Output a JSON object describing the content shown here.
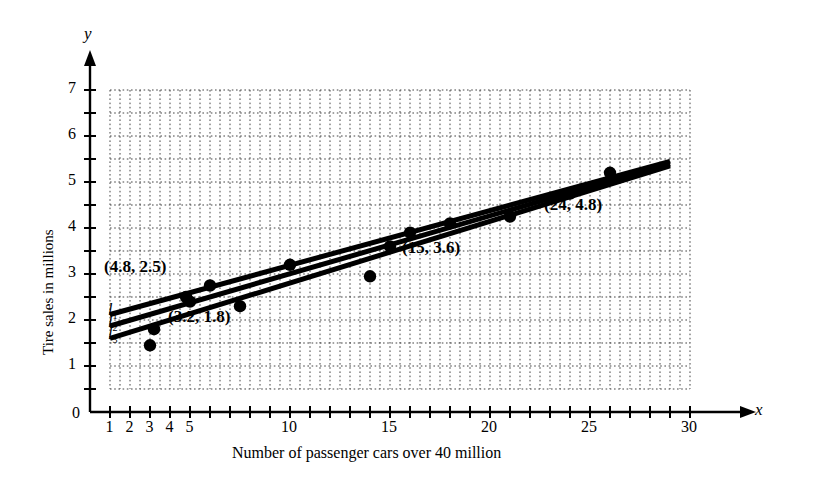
{
  "chart_data": {
    "type": "scatter",
    "title": "",
    "xlabel": "Number of passenger cars over 40 million",
    "ylabel": "Tire sales in millions",
    "x_axis_name": "x",
    "y_axis_name": "y",
    "xlim": [
      0,
      31.5
    ],
    "ylim": [
      0,
      7.6
    ],
    "grid": true,
    "grid_style": "dotted",
    "grid_step": 0.5,
    "grid_x_range": [
      1,
      30
    ],
    "grid_y_range": [
      0.5,
      7
    ],
    "xticks": [
      1,
      2,
      3,
      4,
      5,
      6,
      7,
      8,
      9,
      10,
      11,
      12,
      13,
      14,
      15,
      16,
      17,
      18,
      19,
      20,
      21,
      22,
      23,
      24,
      25,
      26,
      27,
      28,
      29,
      30
    ],
    "xtick_labels": [
      {
        "value": 1,
        "label": "1"
      },
      {
        "value": 2,
        "label": "2"
      },
      {
        "value": 3,
        "label": "3"
      },
      {
        "value": 4,
        "label": "4"
      },
      {
        "value": 5,
        "label": "5"
      },
      {
        "value": 10,
        "label": "10"
      },
      {
        "value": 15,
        "label": "15"
      },
      {
        "value": 20,
        "label": "20"
      },
      {
        "value": 25,
        "label": "25"
      },
      {
        "value": 30,
        "label": "30"
      }
    ],
    "yticks": [
      0.5,
      1,
      1.5,
      2,
      2.5,
      3,
      3.5,
      4,
      4.5,
      5,
      5.5,
      6,
      6.5,
      7
    ],
    "ytick_labels": [
      {
        "value": 1,
        "label": "1"
      },
      {
        "value": 2,
        "label": "2"
      },
      {
        "value": 3,
        "label": "3"
      },
      {
        "value": 4,
        "label": "4"
      },
      {
        "value": 5,
        "label": "5"
      },
      {
        "value": 6,
        "label": "6"
      },
      {
        "value": 7,
        "label": "7"
      }
    ],
    "origin_label": "0",
    "points": [
      {
        "x": 3,
        "y": 1.45
      },
      {
        "x": 4.8,
        "y": 2.5
      },
      {
        "x": 5,
        "y": 2.4
      },
      {
        "x": 6,
        "y": 2.75
      },
      {
        "x": 7.5,
        "y": 2.3
      },
      {
        "x": 10,
        "y": 3.2
      },
      {
        "x": 14,
        "y": 2.95
      },
      {
        "x": 15,
        "y": 3.6
      },
      {
        "x": 16,
        "y": 3.9
      },
      {
        "x": 18,
        "y": 4.1
      },
      {
        "x": 21,
        "y": 4.25
      },
      {
        "x": 24,
        "y": 4.75
      },
      {
        "x": 26,
        "y": 5.2
      },
      {
        "x": 3.2,
        "y": 1.8
      }
    ],
    "series": [
      {
        "name": "l1",
        "type": "line",
        "x": [
          1,
          29
        ],
        "y": [
          2.12,
          5.45
        ]
      },
      {
        "name": "l2",
        "type": "line",
        "x": [
          1,
          29
        ],
        "y": [
          1.87,
          5.4
        ]
      },
      {
        "name": "l3",
        "type": "line",
        "x": [
          1,
          29
        ],
        "y": [
          1.6,
          5.35
        ]
      }
    ],
    "annotations": [
      {
        "text": "(4.8, 2.5)",
        "x": 4.8,
        "y": 2.5,
        "anchor": "left-above"
      },
      {
        "text": "(3.2, 1.8)",
        "x": 3.2,
        "y": 1.8,
        "anchor": "right"
      },
      {
        "text": "(15, 3.6)",
        "x": 15,
        "y": 3.6,
        "anchor": "right-below"
      },
      {
        "text": "(24, 4.8)",
        "x": 24,
        "y": 4.8,
        "anchor": "right-below"
      }
    ],
    "line_labels": [
      {
        "text": "l",
        "sub": "1",
        "x": 1,
        "y": 2.12
      },
      {
        "text": "l",
        "sub": "2",
        "x": 1,
        "y": 1.87
      },
      {
        "text": "l",
        "sub": "3",
        "x": 1,
        "y": 1.6
      }
    ]
  }
}
